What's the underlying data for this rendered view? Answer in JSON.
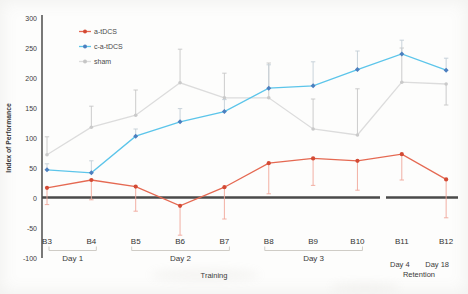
{
  "figure": {
    "background_color": "#fdfdfc",
    "axis_color": "#3f3f3f",
    "zero_line_color": "#4a4a4a",
    "tick_text_color": "#404040",
    "bracket_color": "#cfccc6"
  },
  "legend": {
    "position": "top-left",
    "items": [
      {
        "label": "a-tDCS",
        "line_color": "#e56952",
        "marker_color": "#d34a34"
      },
      {
        "label": "c-a-tDCS",
        "line_color": "#5cc5ea",
        "marker_color": "#4c7fbf"
      },
      {
        "label": "sham",
        "line_color": "#dcdcdc",
        "marker_color": "#c6c6c6"
      }
    ]
  },
  "chart_data": {
    "type": "line",
    "title": "",
    "ylabel": "Index of Performance",
    "xlabel": "Training",
    "phase_labels": {
      "training": "Training",
      "retention": "Retention"
    },
    "ylim": [
      -100,
      300
    ],
    "yticks": [
      300,
      250,
      200,
      150,
      100,
      50,
      0,
      -50,
      -100
    ],
    "grid": false,
    "axis_break_between": [
      "B10",
      "B11"
    ],
    "categories": [
      "B3",
      "B4",
      "B5",
      "B6",
      "B7",
      "B8",
      "B9",
      "B10",
      "B11",
      "B12"
    ],
    "x_groups": [
      {
        "label": "Day 1",
        "from": 0,
        "to": 1
      },
      {
        "label": "Day 2",
        "from": 2,
        "to": 4
      },
      {
        "label": "Day 3",
        "from": 5,
        "to": 7
      },
      {
        "label": "Day 4",
        "at": 8
      },
      {
        "label": "Day 18",
        "at": 9
      }
    ],
    "series": [
      {
        "name": "sham",
        "line_color": "#dcdcdc",
        "marker_color": "#cacaca",
        "err_color": "#c6c6c6",
        "values": [
          72,
          118,
          138,
          192,
          167,
          167,
          115,
          105,
          193,
          190
        ],
        "err_up": [
          30,
          35,
          42,
          56,
          41,
          58,
          50,
          77,
          57,
          0
        ],
        "err_down": [
          0,
          0,
          0,
          0,
          0,
          0,
          0,
          0,
          0,
          35
        ]
      },
      {
        "name": "c-a-tDCS",
        "line_color": "#5cc5ea",
        "marker_color": "#4c7fbf",
        "err_color": "#c3ced6",
        "values": [
          47,
          42,
          103,
          127,
          144,
          183,
          187,
          214,
          240,
          213
        ],
        "err_up": [
          10,
          20,
          12,
          22,
          20,
          39,
          40,
          31,
          23,
          20
        ],
        "err_down": [
          0,
          0,
          0,
          0,
          0,
          0,
          0,
          0,
          0,
          0
        ]
      },
      {
        "name": "a-tDCS",
        "line_color": "#e56952",
        "marker_color": "#d34a34",
        "err_color": "#f0a79a",
        "values": [
          17,
          30,
          19,
          -13,
          18,
          58,
          66,
          62,
          73,
          31
        ],
        "err_up": [
          0,
          0,
          0,
          0,
          0,
          0,
          0,
          0,
          0,
          0
        ],
        "err_down": [
          28,
          33,
          41,
          49,
          53,
          51,
          45,
          49,
          43,
          64
        ]
      }
    ]
  }
}
